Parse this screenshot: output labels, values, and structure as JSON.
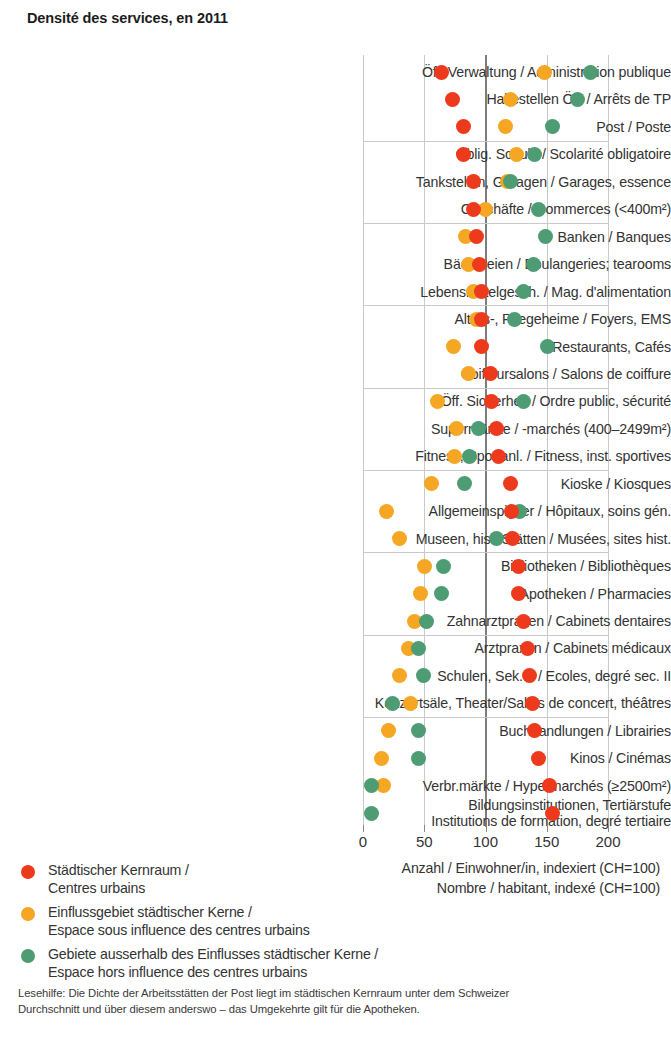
{
  "title": "Densité des services, en 2011",
  "axis": {
    "ticks": [
      0,
      50,
      100,
      150,
      200
    ],
    "caption_de": "Anzahl / Einwohner/in, indexiert (CH=100)",
    "caption_fr": "Nombre / habitant, indexé (CH=100)"
  },
  "legend": [
    {
      "color": "#ee3a1c",
      "line1": "Städtischer Kernraum /",
      "line2": "Centres urbains"
    },
    {
      "color": "#f5a623",
      "line1": "Einflussgebiet städtischer Kerne /",
      "line2": "Espace sous influence des centres urbains"
    },
    {
      "color": "#4e9c73",
      "line1": "Gebiete ausserhalb des Einflusses städtischer Kerne /",
      "line2": "Espace hors influence des centres urbains"
    }
  ],
  "footnote": {
    "line1": "Lesehilfe: Die Dichte der Arbeitsstätten der Post liegt im städtischen Kernraum unter dem Schweizer",
    "line2": "Durchschnitt und über diesem anderswo – das Umgekehrte gilt für die Apotheken."
  },
  "colors": {
    "urban_core": "#ee3a1c",
    "influence": "#f5a623",
    "outside": "#4e9c73",
    "grid": "#c9c9c9",
    "center_grid": "#7d7d7d"
  },
  "chart_data": {
    "type": "scatter",
    "title": "Densité des services, en 2011",
    "xlabel": "Anzahl / Einwohner/in, indexiert (CH=100) / Nombre / habitant, indexé (CH=100)",
    "ylabel": "",
    "xlim": [
      0,
      210
    ],
    "xticks": [
      0,
      50,
      100,
      150,
      200
    ],
    "grid": true,
    "legend_position": "bottom-left",
    "series_names": [
      "Städtischer Kernraum / Centres urbains",
      "Einflussgebiet städtischer Kerne / Espace sous influence des centres urbains",
      "Gebiete ausserhalb des Einflusses städtischer Kerne / Espace hors influence des centres urbains"
    ],
    "categories": [
      "Öff. Verwaltung / Administration publique",
      "Haltestellen ÖV / Arrêts de TP",
      "Post / Poste",
      "Oblig. Schule / Scolarité obligatoire",
      "Tankstellen, Garagen / Garages, essence",
      "Geschäfte / Commerces (<400m²)",
      "Banken / Banques",
      "Bäckereien / Boulangeries; tearooms",
      "Lebensmittelgesch. / Mag. d'alimentation",
      "Alters-, Pflegeheime / Foyers, EMS",
      "Restaurants, Cafés",
      "Coiffeursalons / Salons de coiffure",
      "Öff. Sicherheit / Ordre public, sécurité",
      "Supermärkte / -marchés (400–2499m²)",
      "Fitness, Sportanl. / Fitness, inst. sportives",
      "Kioske / Kiosques",
      "Allgemeinspitäler / Hôpitaux, soins gén.",
      "Museen, hist. Stätten / Musées, sites hist.",
      "Bibliotheken / Bibliothèques",
      "Apotheken / Pharmacies",
      "Zahnarztpraxen / Cabinets dentaires",
      "Arztpraxen / Cabinets médicaux",
      "Schulen, Sek. II / Ecoles, degré sec. II",
      "Konzertsäle, Theater/Salles de concert, théâtres",
      "Buchhandlungen / Librairies",
      "Kinos / Cinémas",
      "Verbr.märkte / Hypermarchés (≥2500m²)",
      "Bildungsinstitutionen, Tertiärstufe|Institutions de formation, degré tertiaire"
    ],
    "series": [
      {
        "name": "Städtischer Kernraum / Centres urbains",
        "color": "#ee3a1c",
        "values": [
          64,
          73,
          82,
          82,
          90,
          90,
          93,
          95,
          97,
          97,
          97,
          104,
          105,
          109,
          111,
          120,
          121,
          122,
          127,
          127,
          131,
          134,
          136,
          138,
          140,
          143,
          152,
          155
        ]
      },
      {
        "name": "Einflussgebiet städtischer Kerne / Espace sous influence des centres urbains",
        "color": "#f5a623",
        "values": [
          148,
          120,
          116,
          125,
          118,
          100,
          84,
          86,
          90,
          93,
          74,
          86,
          61,
          76,
          75,
          56,
          19,
          30,
          50,
          47,
          42,
          37,
          30,
          39,
          21,
          15,
          17,
          null
        ]
      },
      {
        "name": "Gebiete ausserhalb des Einflusses städtischer Kerne / Espace hors influence des centres urbains",
        "color": "#4e9c73",
        "values": [
          186,
          175,
          155,
          140,
          120,
          143,
          149,
          139,
          131,
          124,
          151,
          null,
          131,
          94,
          87,
          83,
          128,
          109,
          66,
          64,
          52,
          45,
          49,
          24,
          45,
          45,
          7,
          7
        ]
      }
    ]
  }
}
